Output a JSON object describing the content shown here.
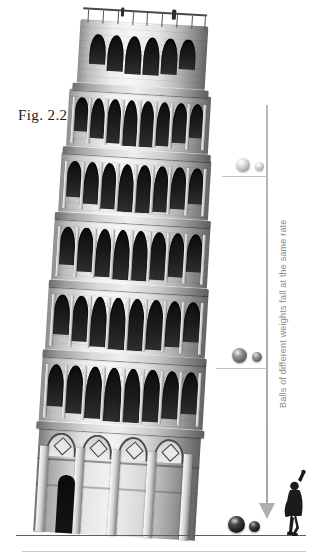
{
  "figure": {
    "label": "Fig. 2.2",
    "vertical_caption": "Balls of different weights fall at the same rate",
    "background_color": "#ffffff",
    "axis_color": "#aeaeae",
    "caption_color": "#8a8a8a"
  },
  "diagram": {
    "axis": {
      "name": "fall-path-axis",
      "top_y": 105,
      "bottom_y": 506,
      "arrow_direction": "down"
    },
    "ground_line": {
      "name": "ground-line",
      "y": 535
    },
    "baseline_rule": {
      "name": "page-rule",
      "y": 551
    },
    "stages": [
      {
        "name": "drop-stage-1",
        "position": "top",
        "tone": "light",
        "color": "#cfcfcf",
        "big_ball_diameter": 14,
        "small_ball_diameter": 9,
        "tick_y": 176
      },
      {
        "name": "drop-stage-2",
        "position": "middle",
        "tone": "mid",
        "color": "#6d6d6d",
        "big_ball_diameter": 15,
        "small_ball_diameter": 10,
        "tick_y": 368
      },
      {
        "name": "drop-stage-3",
        "position": "bottom",
        "tone": "dark",
        "color": "#1a1a1a",
        "big_ball_diameter": 17,
        "small_ball_diameter": 11,
        "tick_y": 535
      }
    ],
    "observer": {
      "name": "observer-figure",
      "description": "Silhouette of a person with raised arm at the tower base"
    }
  },
  "tower": {
    "name": "leaning-tower-of-pisa",
    "lean_degrees": 3.4,
    "tiers": [
      {
        "name": "belfry",
        "arches": 9
      },
      {
        "name": "arcade-tier-6",
        "arches": 12
      },
      {
        "name": "arcade-tier-5",
        "arches": 13
      },
      {
        "name": "arcade-tier-4",
        "arches": 13
      },
      {
        "name": "arcade-tier-3",
        "arches": 13
      },
      {
        "name": "arcade-tier-2",
        "arches": 13
      },
      {
        "name": "base-plinth",
        "arches": 0
      }
    ]
  }
}
